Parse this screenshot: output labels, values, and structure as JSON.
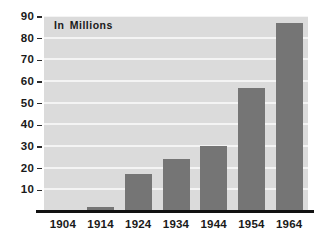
{
  "chart_data": {
    "type": "bar",
    "title": "",
    "subtitle": "",
    "annotation": "In Millions",
    "xlabel": "",
    "ylabel": "",
    "categories": [
      "1904",
      "1914",
      "1924",
      "1934",
      "1944",
      "1954",
      "1964"
    ],
    "values": [
      0,
      2,
      17,
      24,
      30,
      57,
      87
    ],
    "series": [
      {
        "name": "In Millions",
        "values": [
          0,
          2,
          17,
          24,
          30,
          57,
          87
        ]
      }
    ],
    "ylim": [
      0,
      90
    ],
    "ytick_labels": [
      "90",
      "80",
      "70",
      "60",
      "50",
      "40",
      "30",
      "20",
      "10"
    ],
    "ytick_values": [
      90,
      80,
      70,
      60,
      50,
      40,
      30,
      20,
      10
    ],
    "grid": true,
    "grid_orientation": "horizontal",
    "legend": false,
    "legend_position": "none",
    "colors": {
      "bar": "#757575",
      "plot_background": "#dbdbdb",
      "gridline": "#f4f4f4",
      "axis_line": "#111111",
      "text": "#1a1a1a",
      "figure_background": "#ffffff"
    }
  }
}
